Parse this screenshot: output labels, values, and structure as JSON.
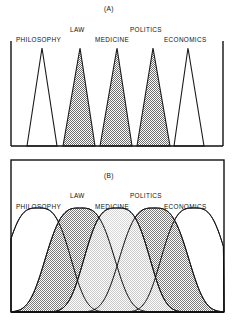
{
  "figure": {
    "title": "",
    "background": "#ffffff",
    "width": 234,
    "height": 324
  },
  "panels": [
    {
      "tag": "(A)",
      "tag_x": 104,
      "tag_y": 5,
      "labels": [
        {
          "text": "PHILOSOPHY",
          "x": 16,
          "y": 36
        },
        {
          "text": "LAW",
          "x": 70,
          "y": 26
        },
        {
          "text": "MEDICINE",
          "x": 95,
          "y": 36
        },
        {
          "text": "POLITICS",
          "x": 130,
          "y": 26
        },
        {
          "text": "ECONOMICS",
          "x": 164,
          "y": 36
        }
      ]
    },
    {
      "tag": "(B)",
      "tag_x": 104,
      "tag_y": 172,
      "labels": [
        {
          "text": "PHILOSOPHY",
          "x": 16,
          "y": 203
        },
        {
          "text": "LAW",
          "x": 70,
          "y": 192
        },
        {
          "text": "MEDICINE",
          "x": 95,
          "y": 203
        },
        {
          "text": "POLITICS",
          "x": 130,
          "y": 192
        },
        {
          "text": "ECONOMICS",
          "x": 164,
          "y": 203
        }
      ]
    }
  ],
  "chart_data": {
    "type": "area",
    "xlabel": "",
    "ylabel": "",
    "grid": false,
    "legend": "none",
    "categories": [
      "PHILOSOPHY",
      "LAW",
      "MEDICINE",
      "POLITICS",
      "ECONOMICS"
    ],
    "panel_a": {
      "tag": "(A)",
      "description": "Five narrow, non-overlapping triangular distributions of equal height spaced evenly across the horizontal axis.",
      "axis": {
        "left_x": 11,
        "right_x": 223,
        "baseline_y": 146,
        "top_y": 48
      },
      "series": [
        {
          "name": "PHILOSOPHY",
          "peak_x": 42,
          "left_x": 27,
          "right_x": 57,
          "peak_y": 48,
          "base_y": 146,
          "fill": "#ffffff",
          "stroke": "#1a1a1a"
        },
        {
          "name": "LAW",
          "peak_x": 80,
          "left_x": 63,
          "right_x": 95,
          "peak_y": 48,
          "base_y": 146,
          "fill": "#a8a8a8",
          "stroke": "#1a1a1a"
        },
        {
          "name": "MEDICINE",
          "peak_x": 117,
          "left_x": 100,
          "right_x": 132,
          "peak_y": 48,
          "base_y": 146,
          "fill": "#a8a8a8",
          "stroke": "#1a1a1a"
        },
        {
          "name": "POLITICS",
          "peak_x": 153,
          "left_x": 137,
          "right_x": 170,
          "peak_y": 48,
          "base_y": 146,
          "fill": "#a8a8a8",
          "stroke": "#1a1a1a"
        },
        {
          "name": "ECONOMICS",
          "peak_x": 188,
          "left_x": 174,
          "right_x": 204,
          "peak_y": 48,
          "base_y": 146,
          "fill": "#ffffff",
          "stroke": "#1a1a1a"
        }
      ]
    },
    "panel_b": {
      "tag": "(B)",
      "description": "Five broad, heavily overlapping bell-shaped (plateau-topped) distributions of equal height spanning the horizontal axis.",
      "frame": {
        "left_x": 11,
        "right_x": 224,
        "top_y": 160,
        "bottom_y": 312
      },
      "baseline_y": 312,
      "peak_y": 208,
      "series": [
        {
          "name": "PHILOSOPHY",
          "peak_x": 38,
          "half_width": 38,
          "fill": "#ffffff",
          "stroke": "#1a1a1a"
        },
        {
          "name": "LAW",
          "peak_x": 80,
          "half_width": 40,
          "fill": "#ababab",
          "stroke": "#1a1a1a"
        },
        {
          "name": "MEDICINE",
          "peak_x": 117,
          "half_width": 38,
          "fill": "#e8e8e8",
          "stroke": "#1a1a1a"
        },
        {
          "name": "POLITICS",
          "peak_x": 154,
          "half_width": 40,
          "fill": "#ababab",
          "stroke": "#1a1a1a"
        },
        {
          "name": "ECONOMICS",
          "peak_x": 194,
          "half_width": 38,
          "fill": "#ffffff",
          "stroke": "#1a1a1a"
        }
      ]
    }
  }
}
